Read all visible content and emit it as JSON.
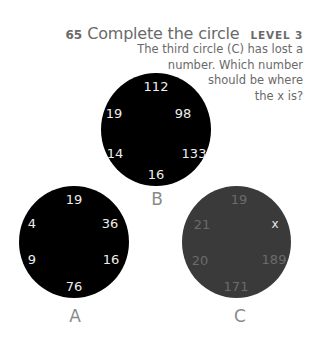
{
  "header": {
    "puzzle_number": "65",
    "title": "Complete the circle",
    "level": "LEVEL 3"
  },
  "description": {
    "lines": [
      "The third circle (C) has lost a",
      "number. Which number",
      "should be where",
      "the x is?"
    ]
  },
  "circles": {
    "A": {
      "label": "A",
      "fill": "#000000",
      "numbers": {
        "top": "19",
        "top_right": "36",
        "bottom_right": "16",
        "bottom": "76",
        "bottom_left": "9",
        "top_left": "4"
      }
    },
    "B": {
      "label": "B",
      "fill": "#000000",
      "numbers": {
        "top": "112",
        "top_right": "98",
        "bottom_right": "133",
        "bottom": "16",
        "bottom_left": "14",
        "top_left": "19"
      }
    },
    "C": {
      "label": "C",
      "fill": "#3a3a3a",
      "numbers": {
        "top": "19",
        "top_right": "x",
        "bottom_right": "189",
        "bottom": "171",
        "bottom_left": "20",
        "top_left": "21"
      }
    }
  }
}
